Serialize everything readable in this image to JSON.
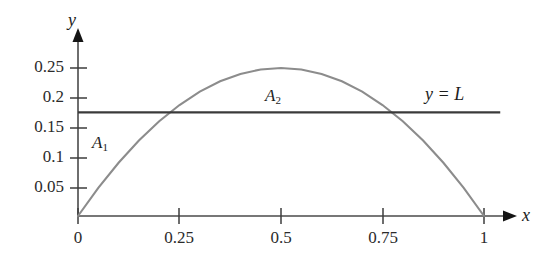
{
  "chart_data": {
    "type": "line",
    "title": "",
    "xlabel": "x",
    "ylabel": "y",
    "xlim": [
      0,
      1.05
    ],
    "ylim": [
      0,
      0.285
    ],
    "grid": false,
    "legend": "none",
    "x_ticks": [
      "0",
      "0.25",
      "0.5",
      "0.75",
      "1"
    ],
    "x_tick_values": [
      0,
      0.25,
      0.5,
      0.75,
      1
    ],
    "y_ticks": [
      "0.05",
      "0.1",
      "0.15",
      "0.2",
      "0.25"
    ],
    "y_tick_values": [
      0.05,
      0.1,
      0.15,
      0.2,
      0.25
    ],
    "series": [
      {
        "name": "parabola",
        "equation": "y = x(1 - x)",
        "color": "#8c8c8c",
        "x": [
          0,
          0.05,
          0.1,
          0.15,
          0.2,
          0.25,
          0.3,
          0.35,
          0.4,
          0.45,
          0.5,
          0.55,
          0.6,
          0.65,
          0.7,
          0.75,
          0.8,
          0.85,
          0.9,
          0.95,
          1
        ],
        "values": [
          0,
          0.0475,
          0.09,
          0.1275,
          0.16,
          0.1875,
          0.21,
          0.2275,
          0.24,
          0.2475,
          0.25,
          0.2475,
          0.24,
          0.2275,
          0.21,
          0.1875,
          0.16,
          0.1275,
          0.09,
          0.0475,
          0
        ]
      },
      {
        "name": "horizontal-mean-line",
        "equation": "y = L",
        "color": "#3a3a3a",
        "constant_y": 0.175,
        "x": [
          0,
          1.04
        ],
        "values": [
          0.175,
          0.175
        ]
      }
    ],
    "annotations": [
      {
        "name": "A1",
        "text": "A",
        "subscript": "1",
        "x": 0.1,
        "y": 0.135
      },
      {
        "name": "A2",
        "text": "A",
        "subscript": "2",
        "x": 0.47,
        "y": 0.205
      },
      {
        "name": "line-label",
        "text": "y = L",
        "x": 0.88,
        "y": 0.215
      }
    ],
    "intersections_x": [
      0.25,
      0.75
    ]
  },
  "axes": {
    "y_axis_name": "y",
    "x_axis_name": "x"
  },
  "y_tick_labels": {
    "t0": "0.25",
    "t1": "0.2",
    "t2": "0.15",
    "t3": "0.1",
    "t4": "0.05"
  },
  "x_tick_labels": {
    "t0": "0",
    "t1": "0.25",
    "t2": "0.5",
    "t3": "0.75",
    "t4": "1"
  },
  "annotations": {
    "a1_base": "A",
    "a1_sub": "1",
    "a2_base": "A",
    "a2_sub": "2",
    "line_label": "y = L"
  },
  "colors": {
    "curve": "#8c8c8c",
    "level_line": "#3a3a3a",
    "axis": "#4a4a4a",
    "text": "#1d1d1d"
  }
}
